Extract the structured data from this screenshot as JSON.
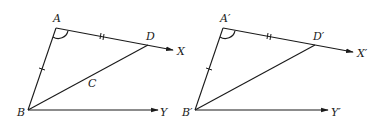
{
  "diagram": {
    "colors": {
      "stroke": "#1a1a1a",
      "background": "#ffffff"
    },
    "left_figure": {
      "labels": {
        "A": "A",
        "D": "D",
        "X": "X",
        "B": "B",
        "C": "C",
        "Y": "Y"
      },
      "marks": [
        "angle-arc-at-A",
        "single-tick-on-AB",
        "double-tick-on-AD"
      ]
    },
    "right_figure": {
      "labels": {
        "A": "A′",
        "D": "D′",
        "X": "X′",
        "B": "B′",
        "Y": "Y′"
      },
      "marks": [
        "angle-arc-at-A′",
        "single-tick-on-A′B′",
        "double-tick-on-A′D′"
      ]
    }
  }
}
